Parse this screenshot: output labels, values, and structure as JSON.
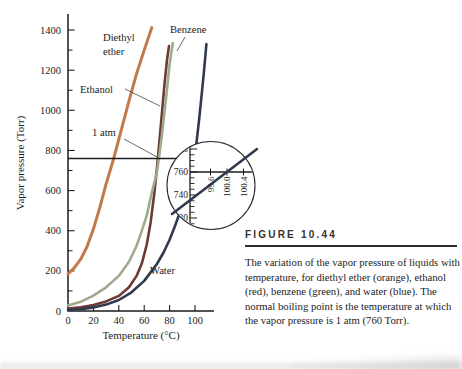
{
  "figure": {
    "label": "FIGURE 10.44",
    "caption": "The variation of the vapor pressure of liquids with temperature, for diethyl ether (orange), ethanol (red), benzene (green), and water (blue). The normal boiling point is the temperature at which the vapor pressure is 1 atm (760 Torr)."
  },
  "chart_data": {
    "type": "line",
    "title": "",
    "xlabel": "Temperature (°C)",
    "ylabel": "Vapor pressure (Torr)",
    "xlim": [
      0,
      115
    ],
    "ylim": [
      0,
      1480
    ],
    "x_ticks": [
      0,
      20,
      40,
      60,
      80,
      100
    ],
    "y_ticks": [
      0,
      200,
      400,
      600,
      800,
      1000,
      1200,
      1400
    ],
    "y_minor_step": 100,
    "grid": false,
    "legend_position": "labels-on-curves",
    "reference_line": {
      "label": "1 atm",
      "pressure_torr": 760
    },
    "series": [
      {
        "name": "Diethyl ether",
        "color": "#c27a4b",
        "points": [
          [
            0,
            185
          ],
          [
            5,
            215
          ],
          [
            10,
            258
          ],
          [
            15,
            320
          ],
          [
            20,
            408
          ],
          [
            25,
            515
          ],
          [
            30,
            633
          ],
          [
            36,
            760
          ],
          [
            42,
            903
          ],
          [
            48,
            1047
          ],
          [
            54,
            1183
          ],
          [
            60,
            1300
          ],
          [
            66,
            1412
          ]
        ]
      },
      {
        "name": "Ethanol",
        "color": "#6e3a36",
        "points": [
          [
            0,
            12
          ],
          [
            10,
            18
          ],
          [
            20,
            30
          ],
          [
            30,
            48
          ],
          [
            40,
            75
          ],
          [
            48,
            118
          ],
          [
            54,
            175
          ],
          [
            58,
            235
          ],
          [
            62,
            330
          ],
          [
            65,
            440
          ],
          [
            68,
            590
          ],
          [
            70,
            710
          ],
          [
            72,
            845
          ],
          [
            74,
            990
          ],
          [
            76,
            1130
          ],
          [
            78,
            1255
          ],
          [
            79.5,
            1320
          ]
        ]
      },
      {
        "name": "Benzene",
        "color": "#9dab8e",
        "points": [
          [
            0,
            28
          ],
          [
            10,
            46
          ],
          [
            20,
            76
          ],
          [
            30,
            118
          ],
          [
            40,
            175
          ],
          [
            48,
            245
          ],
          [
            54,
            325
          ],
          [
            58,
            398
          ],
          [
            62,
            475
          ],
          [
            66,
            590
          ],
          [
            70,
            690
          ],
          [
            72,
            780
          ],
          [
            74,
            880
          ],
          [
            77,
            1050
          ],
          [
            80,
            1230
          ],
          [
            82.5,
            1335
          ]
        ]
      },
      {
        "name": "Water",
        "color": "#30394f",
        "points": [
          [
            0,
            5
          ],
          [
            10,
            9
          ],
          [
            20,
            18
          ],
          [
            30,
            32
          ],
          [
            40,
            55
          ],
          [
            50,
            93
          ],
          [
            60,
            150
          ],
          [
            70,
            234
          ],
          [
            75,
            289
          ],
          [
            80,
            355
          ],
          [
            84,
            420
          ],
          [
            87,
            472
          ]
        ],
        "points_upper": [
          [
            101,
            830
          ],
          [
            103,
            940
          ],
          [
            105,
            1060
          ],
          [
            107,
            1190
          ],
          [
            109,
            1330
          ]
        ]
      }
    ],
    "inset": {
      "shape": "magnifier-circle",
      "magnifies": "normal boiling point of water",
      "y_tick_values": [
        780,
        760,
        740,
        720
      ],
      "y_minor_step_torr": 5,
      "x_tick_labels": [
        "99.6",
        "100.0",
        "100.4"
      ],
      "pressure_line_torr": 760,
      "water_crosses": {
        "temperature_c": "100.0",
        "pressure_torr": 760
      }
    }
  }
}
